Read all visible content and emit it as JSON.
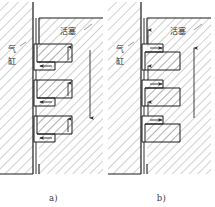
{
  "figure": {
    "type": "engineering-cross-section",
    "panels": [
      {
        "id": "a",
        "caption": "a)",
        "labels": {
          "cylinder": "气缸",
          "cylinder_char_1": "气",
          "cylinder_char_2": "缸",
          "piston": "活塞"
        },
        "flow_direction": "down",
        "seal_steps": 3
      },
      {
        "id": "b",
        "caption": "b)",
        "labels": {
          "cylinder": "气缸",
          "cylinder_char_1": "气",
          "cylinder_char_2": "缸",
          "piston": "活塞"
        },
        "flow_direction": "up",
        "seal_steps": 3
      }
    ],
    "colors": {
      "line": "#1a1a1a",
      "hatch": "#8a8a8a",
      "background": "#ffffff",
      "arrow": "#2b2b2b"
    }
  }
}
